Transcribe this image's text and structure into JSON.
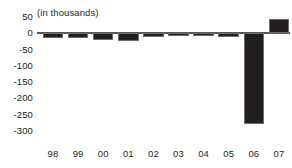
{
  "chart_data": {
    "type": "bar",
    "title": "",
    "subtitle": "",
    "units_note": "(in thousands)",
    "xlabel": "",
    "ylabel": "",
    "categories": [
      "98",
      "99",
      "00",
      "01",
      "02",
      "03",
      "04",
      "05",
      "06",
      "07"
    ],
    "values": [
      -15,
      -16,
      -20,
      -25,
      -12,
      -6,
      -6,
      -10,
      -280,
      43
    ],
    "ylim": [
      -300,
      50
    ],
    "ytick_values": [
      50,
      0,
      -50,
      -100,
      -150,
      -200,
      -250,
      -300
    ],
    "ytick_labels": [
      "50",
      "0",
      "-50",
      "-100",
      "-150",
      "-200",
      "-250",
      "-300"
    ],
    "grid": false,
    "legend": false,
    "legend_position": "none",
    "series": [
      {
        "name": "",
        "values": [
          -15,
          -16,
          -20,
          -25,
          -12,
          -6,
          -6,
          -10,
          -280,
          43
        ]
      }
    ],
    "bar_color": "#231f20",
    "axis_color": "#58595b",
    "text_color": "#231f20",
    "background_color": "#ffffff"
  }
}
